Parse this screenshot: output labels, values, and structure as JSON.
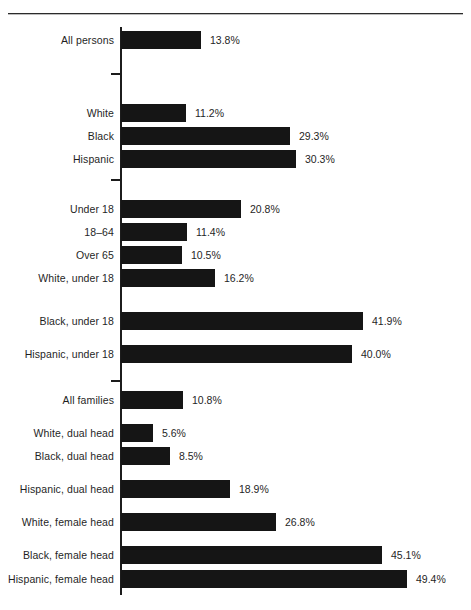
{
  "chart_data": {
    "type": "bar",
    "orientation": "horizontal",
    "title": "",
    "subtitle": "",
    "xlabel": "",
    "ylabel": "",
    "xlim": [
      0,
      50
    ],
    "grid": false,
    "legend": null,
    "value_suffix": "%",
    "groups": [
      {
        "name": "all-persons",
        "categories": [
          "All persons"
        ],
        "values": [
          13.8
        ],
        "labels": [
          "13.8%"
        ]
      },
      {
        "name": "race-ethnicity",
        "categories": [
          "White",
          "Black",
          "Hispanic"
        ],
        "values": [
          11.2,
          29.3,
          30.3
        ],
        "labels": [
          "11.2%",
          "29.3%",
          "30.3%"
        ]
      },
      {
        "name": "age-and-age-by-race",
        "categories": [
          "Under 18",
          "18–64",
          "Over 65",
          "White, under 18",
          "Black, under 18",
          "Hispanic, under 18"
        ],
        "values": [
          20.8,
          11.4,
          10.5,
          16.2,
          41.9,
          40.0
        ],
        "labels": [
          "20.8%",
          "11.4%",
          "10.5%",
          "16.2%",
          "41.9%",
          "40.0%"
        ]
      },
      {
        "name": "families",
        "categories": [
          "All families",
          "White, dual head",
          "Black, dual head",
          "Hispanic, dual head",
          "White, female head",
          "Black, female head",
          "Hispanic, female head"
        ],
        "values": [
          10.8,
          5.6,
          8.5,
          18.9,
          26.8,
          45.1,
          49.4
        ],
        "labels": [
          "10.8%",
          "5.6%",
          "8.5%",
          "18.9%",
          "26.8%",
          "45.1%",
          "49.4%"
        ]
      }
    ],
    "categories": [
      "All persons",
      "White",
      "Black",
      "Hispanic",
      "Under 18",
      "18–64",
      "Over 65",
      "White, under 18",
      "Black, under 18",
      "Hispanic, under 18",
      "All families",
      "White, dual head",
      "Black, dual head",
      "Hispanic, dual head",
      "White, female head",
      "Black, female head",
      "Hispanic, female head"
    ],
    "values": [
      13.8,
      11.2,
      29.3,
      30.3,
      20.8,
      11.4,
      10.5,
      16.2,
      41.9,
      40.0,
      10.8,
      5.6,
      8.5,
      18.9,
      26.8,
      45.1,
      49.4
    ],
    "labels": [
      "13.8%",
      "11.2%",
      "29.3%",
      "30.3%",
      "20.8%",
      "11.4%",
      "10.5%",
      "16.2%",
      "41.9%",
      "40.0%",
      "10.8%",
      "5.6%",
      "8.5%",
      "18.9%",
      "26.8%",
      "45.1%",
      "49.4%"
    ]
  },
  "style": {
    "bar_color": "#111111",
    "axis_color": "#1c1c1c",
    "text_color": "#1f1f1f",
    "background": "#ffffff"
  },
  "layout": {
    "axis_x": 121,
    "px_per_percent": 5.78,
    "bar_height": 18,
    "row_tops": [
      30,
      103,
      126,
      149,
      199,
      222,
      245,
      268,
      311,
      344,
      390,
      423,
      446,
      479,
      512,
      545,
      569
    ],
    "tick_ys": [
      73,
      179,
      380
    ]
  }
}
